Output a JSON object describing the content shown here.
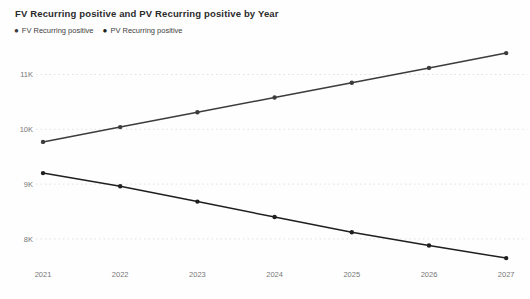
{
  "title": "FV Recurring positive and PV Recurring positive by Year",
  "legend": {
    "items": [
      {
        "label": "FV Recurring positive",
        "color": "#3c3c3c"
      },
      {
        "label": "PV Recurring positive",
        "color": "#1f1f1f"
      }
    ]
  },
  "chart_data": {
    "type": "line",
    "title": "FV Recurring positive and PV Recurring positive by Year",
    "x": [
      "2021",
      "2022",
      "2023",
      "2024",
      "2025",
      "2026",
      "2027"
    ],
    "xlabel": "Year",
    "ylabel": "",
    "series": [
      {
        "name": "FV Recurring positive",
        "color": "#3c3c3c",
        "values": [
          9770,
          10040,
          10310,
          10580,
          10850,
          11120,
          11390
        ]
      },
      {
        "name": "PV Recurring positive",
        "color": "#1f1f1f",
        "values": [
          9200,
          8960,
          8680,
          8400,
          8120,
          7880,
          7650
        ]
      }
    ],
    "ylim": [
      7500,
      11600
    ],
    "y_ticks": [
      8000,
      9000,
      10000,
      11000
    ],
    "y_tick_labels": [
      "8K",
      "9K",
      "10K",
      "11K"
    ],
    "grid": "horizontal-dotted",
    "legend_position": "top-left",
    "markers": true
  },
  "colors": {
    "background": "#fefefe",
    "title_text": "#2b2b2b",
    "axis_text": "#777777",
    "gridline": "#d9d9d9"
  }
}
